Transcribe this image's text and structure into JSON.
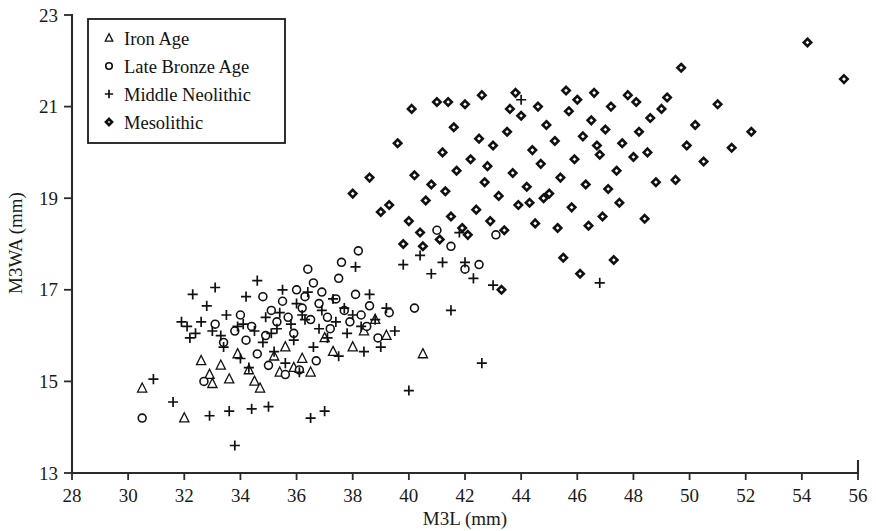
{
  "chart_data": {
    "type": "scatter",
    "title": "",
    "xlabel": "M3L (mm)",
    "ylabel": "M3WA (mm)",
    "xlim": [
      28,
      56
    ],
    "ylim": [
      13,
      23
    ],
    "xticks": [
      28,
      30,
      32,
      34,
      36,
      38,
      40,
      42,
      44,
      46,
      48,
      50,
      52,
      54,
      56
    ],
    "yticks": [
      13,
      15,
      17,
      19,
      21,
      23
    ],
    "grid": false,
    "legend_position": "top-left",
    "series": [
      {
        "name": "Iron Age",
        "marker": "triangle",
        "points": [
          [
            30.5,
            14.85
          ],
          [
            32.0,
            14.2
          ],
          [
            32.6,
            15.45
          ],
          [
            32.9,
            15.15
          ],
          [
            33.0,
            14.95
          ],
          [
            33.3,
            15.35
          ],
          [
            33.6,
            15.05
          ],
          [
            33.9,
            15.6
          ],
          [
            34.3,
            15.25
          ],
          [
            34.5,
            15.0
          ],
          [
            34.7,
            14.85
          ],
          [
            35.2,
            15.55
          ],
          [
            35.4,
            15.2
          ],
          [
            35.6,
            15.75
          ],
          [
            35.9,
            15.3
          ],
          [
            36.2,
            15.5
          ],
          [
            36.5,
            15.2
          ],
          [
            37.0,
            15.95
          ],
          [
            37.3,
            15.65
          ],
          [
            38.0,
            15.75
          ],
          [
            38.4,
            16.1
          ],
          [
            38.8,
            16.35
          ],
          [
            39.2,
            16.0
          ],
          [
            40.5,
            15.6
          ]
        ]
      },
      {
        "name": "Late Bronze Age",
        "marker": "circle",
        "points": [
          [
            30.5,
            14.2
          ],
          [
            32.7,
            15.0
          ],
          [
            33.1,
            16.25
          ],
          [
            33.4,
            15.85
          ],
          [
            33.8,
            16.1
          ],
          [
            34.0,
            16.45
          ],
          [
            34.2,
            15.9
          ],
          [
            34.4,
            16.2
          ],
          [
            34.6,
            15.6
          ],
          [
            34.9,
            16.0
          ],
          [
            35.1,
            16.55
          ],
          [
            35.3,
            16.3
          ],
          [
            35.5,
            16.75
          ],
          [
            35.7,
            16.4
          ],
          [
            35.9,
            16.05
          ],
          [
            36.0,
            17.0
          ],
          [
            36.2,
            16.6
          ],
          [
            36.3,
            16.85
          ],
          [
            36.5,
            16.35
          ],
          [
            36.6,
            17.15
          ],
          [
            36.8,
            16.7
          ],
          [
            36.9,
            16.95
          ],
          [
            37.1,
            16.4
          ],
          [
            37.2,
            16.15
          ],
          [
            37.4,
            16.8
          ],
          [
            37.5,
            17.25
          ],
          [
            37.7,
            16.55
          ],
          [
            37.9,
            16.3
          ],
          [
            38.1,
            16.9
          ],
          [
            38.3,
            16.45
          ],
          [
            38.5,
            16.2
          ],
          [
            38.6,
            16.65
          ],
          [
            38.9,
            15.95
          ],
          [
            39.3,
            16.5
          ],
          [
            35.0,
            15.35
          ],
          [
            35.6,
            15.15
          ],
          [
            36.1,
            15.25
          ],
          [
            36.7,
            15.45
          ],
          [
            34.8,
            16.85
          ],
          [
            36.4,
            17.45
          ],
          [
            37.6,
            17.6
          ],
          [
            38.2,
            17.85
          ],
          [
            41.5,
            17.95
          ],
          [
            42.0,
            17.45
          ],
          [
            42.5,
            17.55
          ],
          [
            43.1,
            18.2
          ],
          [
            41.0,
            18.3
          ],
          [
            40.2,
            16.6
          ]
        ]
      },
      {
        "name": "Middle Neolithic",
        "marker": "plus",
        "points": [
          [
            30.9,
            15.05
          ],
          [
            31.6,
            14.55
          ],
          [
            32.1,
            16.2
          ],
          [
            32.3,
            16.9
          ],
          [
            32.4,
            16.05
          ],
          [
            32.6,
            16.3
          ],
          [
            32.8,
            16.65
          ],
          [
            32.9,
            14.25
          ],
          [
            33.0,
            16.1
          ],
          [
            33.1,
            17.05
          ],
          [
            33.3,
            16.0
          ],
          [
            33.4,
            15.75
          ],
          [
            33.5,
            16.45
          ],
          [
            33.6,
            14.35
          ],
          [
            33.8,
            13.6
          ],
          [
            33.9,
            16.2
          ],
          [
            34.0,
            15.5
          ],
          [
            34.2,
            16.85
          ],
          [
            34.3,
            15.3
          ],
          [
            34.4,
            14.4
          ],
          [
            34.5,
            16.1
          ],
          [
            34.6,
            17.2
          ],
          [
            34.8,
            15.85
          ],
          [
            34.9,
            16.4
          ],
          [
            35.0,
            14.45
          ],
          [
            35.1,
            16.05
          ],
          [
            35.2,
            15.65
          ],
          [
            35.4,
            16.5
          ],
          [
            35.5,
            17.0
          ],
          [
            35.6,
            15.4
          ],
          [
            35.8,
            16.25
          ],
          [
            35.9,
            15.9
          ],
          [
            36.0,
            16.7
          ],
          [
            36.1,
            15.2
          ],
          [
            36.3,
            16.35
          ],
          [
            36.4,
            16.95
          ],
          [
            36.5,
            14.2
          ],
          [
            36.6,
            15.75
          ],
          [
            36.8,
            16.15
          ],
          [
            36.9,
            16.55
          ],
          [
            37.0,
            14.35
          ],
          [
            37.1,
            15.95
          ],
          [
            37.3,
            16.8
          ],
          [
            37.4,
            16.3
          ],
          [
            37.5,
            15.55
          ],
          [
            37.7,
            16.6
          ],
          [
            37.8,
            16.05
          ],
          [
            38.0,
            16.45
          ],
          [
            38.1,
            17.5
          ],
          [
            38.3,
            16.2
          ],
          [
            38.4,
            15.65
          ],
          [
            38.6,
            16.9
          ],
          [
            38.8,
            16.35
          ],
          [
            39.0,
            15.75
          ],
          [
            39.2,
            16.6
          ],
          [
            39.5,
            16.1
          ],
          [
            39.8,
            17.55
          ],
          [
            40.0,
            14.8
          ],
          [
            40.4,
            17.75
          ],
          [
            40.8,
            17.35
          ],
          [
            41.2,
            17.6
          ],
          [
            41.5,
            16.55
          ],
          [
            41.8,
            18.25
          ],
          [
            42.0,
            17.6
          ],
          [
            42.3,
            17.25
          ],
          [
            42.6,
            15.4
          ],
          [
            43.0,
            17.1
          ],
          [
            44.0,
            21.15
          ],
          [
            46.8,
            17.15
          ],
          [
            31.9,
            16.3
          ],
          [
            32.2,
            15.95
          ],
          [
            34.1,
            16.25
          ],
          [
            35.3,
            16.15
          ],
          [
            36.2,
            16.45
          ]
        ]
      },
      {
        "name": "Mesolithic",
        "marker": "diamond",
        "points": [
          [
            38.0,
            19.1
          ],
          [
            38.6,
            19.45
          ],
          [
            39.3,
            18.85
          ],
          [
            39.6,
            20.2
          ],
          [
            40.0,
            18.5
          ],
          [
            40.2,
            19.5
          ],
          [
            40.4,
            18.25
          ],
          [
            40.6,
            18.95
          ],
          [
            40.8,
            19.3
          ],
          [
            41.0,
            21.1
          ],
          [
            41.2,
            20.0
          ],
          [
            41.3,
            19.15
          ],
          [
            41.5,
            18.6
          ],
          [
            41.7,
            19.6
          ],
          [
            41.9,
            18.35
          ],
          [
            42.0,
            21.05
          ],
          [
            42.2,
            19.85
          ],
          [
            42.4,
            18.75
          ],
          [
            42.5,
            20.3
          ],
          [
            42.7,
            19.35
          ],
          [
            42.9,
            18.5
          ],
          [
            43.0,
            20.15
          ],
          [
            43.2,
            19.05
          ],
          [
            43.3,
            17.0
          ],
          [
            43.5,
            20.45
          ],
          [
            43.7,
            19.55
          ],
          [
            43.9,
            18.85
          ],
          [
            44.0,
            20.8
          ],
          [
            44.2,
            19.25
          ],
          [
            44.4,
            20.05
          ],
          [
            44.5,
            18.45
          ],
          [
            44.7,
            19.75
          ],
          [
            44.9,
            20.6
          ],
          [
            45.0,
            19.1
          ],
          [
            45.2,
            20.25
          ],
          [
            45.4,
            19.45
          ],
          [
            45.5,
            17.7
          ],
          [
            45.7,
            20.9
          ],
          [
            45.9,
            19.85
          ],
          [
            46.0,
            21.15
          ],
          [
            46.2,
            20.35
          ],
          [
            46.3,
            19.3
          ],
          [
            46.5,
            20.7
          ],
          [
            46.6,
            21.3
          ],
          [
            46.8,
            19.95
          ],
          [
            46.9,
            18.6
          ],
          [
            47.0,
            20.5
          ],
          [
            47.2,
            21.0
          ],
          [
            47.4,
            19.6
          ],
          [
            47.6,
            20.2
          ],
          [
            47.8,
            21.25
          ],
          [
            48.0,
            19.9
          ],
          [
            48.2,
            20.45
          ],
          [
            48.4,
            18.55
          ],
          [
            48.6,
            20.75
          ],
          [
            48.8,
            19.35
          ],
          [
            49.0,
            20.95
          ],
          [
            49.2,
            21.2
          ],
          [
            49.5,
            19.4
          ],
          [
            49.7,
            21.85
          ],
          [
            49.9,
            20.15
          ],
          [
            50.2,
            20.6
          ],
          [
            50.5,
            19.8
          ],
          [
            51.0,
            21.05
          ],
          [
            51.5,
            20.1
          ],
          [
            52.2,
            20.45
          ],
          [
            54.2,
            22.4
          ],
          [
            55.5,
            21.6
          ],
          [
            39.8,
            18.0
          ],
          [
            40.5,
            17.95
          ],
          [
            41.1,
            18.1
          ],
          [
            41.6,
            20.55
          ],
          [
            42.1,
            18.2
          ],
          [
            42.8,
            19.7
          ],
          [
            43.4,
            18.3
          ],
          [
            43.8,
            21.3
          ],
          [
            44.3,
            18.9
          ],
          [
            44.8,
            19.0
          ],
          [
            45.3,
            18.35
          ],
          [
            45.8,
            18.8
          ],
          [
            46.4,
            18.4
          ],
          [
            46.7,
            20.15
          ],
          [
            47.1,
            19.2
          ],
          [
            47.5,
            18.9
          ],
          [
            48.1,
            21.1
          ],
          [
            48.5,
            20.0
          ],
          [
            39.0,
            18.7
          ],
          [
            40.1,
            20.95
          ],
          [
            41.4,
            21.1
          ],
          [
            42.6,
            21.25
          ],
          [
            43.6,
            20.95
          ],
          [
            44.6,
            21.0
          ],
          [
            45.6,
            21.35
          ],
          [
            46.1,
            17.35
          ],
          [
            47.3,
            17.65
          ]
        ]
      }
    ]
  },
  "legend": {
    "entries": [
      {
        "label": "Iron Age",
        "marker": "triangle"
      },
      {
        "label": "Late Bronze Age",
        "marker": "circle"
      },
      {
        "label": "Middle Neolithic",
        "marker": "plus"
      },
      {
        "label": "Mesolithic",
        "marker": "diamond"
      }
    ]
  }
}
